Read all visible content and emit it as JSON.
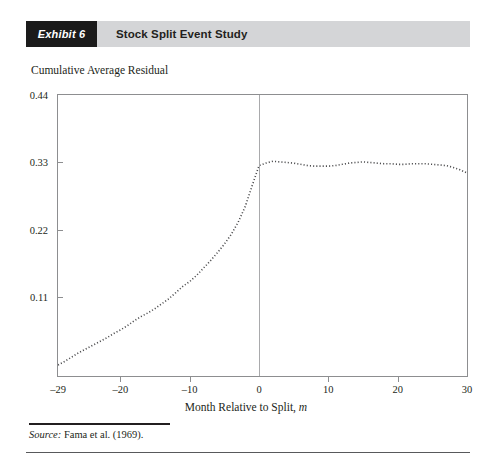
{
  "exhibit": {
    "tag": "Exhibit 6",
    "title": "Stock Split Event Study"
  },
  "source": {
    "label": "Source:",
    "text": " Fama et al. (1969)."
  },
  "chart_data": {
    "type": "line",
    "title": "Stock Split Event Study",
    "xlabel": "Month Relative to Split, m",
    "ylabel": "Cumulative Average Residual",
    "xlim": [
      -29,
      30
    ],
    "ylim": [
      -0.018,
      0.44
    ],
    "grid": false,
    "legend": null,
    "marker": "dotted",
    "series_color": "#4d4d4f",
    "event_line_x": 0,
    "xticks": [
      -29,
      -20,
      -10,
      0,
      10,
      20,
      30
    ],
    "xtick_labels": [
      "–29",
      "–20",
      "–10",
      "0",
      "10",
      "20",
      "30"
    ],
    "yticks": [
      0.11,
      0.22,
      0.33,
      0.44
    ],
    "ytick_labels": [
      "0.11",
      "0.22",
      "0.33",
      "0.44"
    ],
    "x": [
      -29,
      -28,
      -27,
      -26,
      -25,
      -24,
      -23,
      -22,
      -21,
      -20,
      -19,
      -18,
      -17,
      -16,
      -15,
      -14,
      -13,
      -12,
      -11,
      -10,
      -9,
      -8,
      -7,
      -6,
      -5,
      -4,
      -3,
      -2,
      -1,
      0,
      1,
      2,
      3,
      4,
      5,
      6,
      7,
      8,
      9,
      10,
      11,
      12,
      13,
      14,
      15,
      16,
      17,
      18,
      19,
      20,
      21,
      22,
      23,
      24,
      25,
      26,
      27,
      28,
      29,
      30
    ],
    "values": [
      0.0,
      0.006,
      0.013,
      0.02,
      0.026,
      0.032,
      0.038,
      0.044,
      0.051,
      0.057,
      0.064,
      0.072,
      0.079,
      0.085,
      0.092,
      0.1,
      0.108,
      0.118,
      0.128,
      0.136,
      0.146,
      0.158,
      0.17,
      0.183,
      0.197,
      0.213,
      0.233,
      0.258,
      0.292,
      0.325,
      0.329,
      0.332,
      0.331,
      0.33,
      0.329,
      0.327,
      0.325,
      0.324,
      0.324,
      0.324,
      0.325,
      0.327,
      0.329,
      0.33,
      0.331,
      0.33,
      0.329,
      0.328,
      0.328,
      0.327,
      0.327,
      0.328,
      0.328,
      0.328,
      0.327,
      0.326,
      0.325,
      0.322,
      0.318,
      0.313
    ]
  }
}
